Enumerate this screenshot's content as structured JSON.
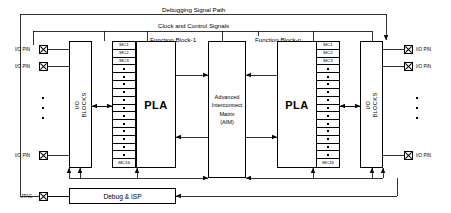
{
  "diagram": {
    "top_labels": {
      "debugging_signal_path": "Debugging Signal Path",
      "clock_and_control_signals": "Clock and Control Signals"
    },
    "function_blocks": [
      {
        "id": "fb1",
        "label": "Function Block-1",
        "pla_label": "PLA"
      },
      {
        "id": "fbn",
        "label": "Function Block-n",
        "pla_label": "PLA"
      }
    ],
    "io_blocks": [
      {
        "id": "io-left",
        "line1": "I/O",
        "line2": "BLOCKS"
      },
      {
        "id": "io-right",
        "line1": "I/O",
        "line2": "BLOCKS"
      }
    ],
    "aim": {
      "lines": [
        "Advanced",
        "Interconnect",
        "Matrix",
        "(AIM)"
      ]
    },
    "debug_isp": {
      "label": "Debug & ISP"
    },
    "macrocells": {
      "top_labels": [
        "MC1",
        "MC2",
        "MC3"
      ],
      "bottom_label": "MC16",
      "dot_rows": 12,
      "total_rows": 16
    },
    "pins": {
      "io_pin_label": "I/O PIN",
      "jtag_label": "JTAG",
      "left": [
        {
          "label": "I/O PIN"
        },
        {
          "label": "I/O PIN"
        },
        {
          "label": "I/O PIN"
        }
      ],
      "right": [
        {
          "label": "I/O PIN"
        },
        {
          "label": "I/O PIN"
        },
        {
          "label": "I/O PIN"
        }
      ],
      "jtag": {
        "label": "JTAG"
      }
    },
    "ellipsis_dots": 3,
    "colors": {
      "line": "#000000",
      "background": "#ffffff",
      "fill": "#ffffff"
    }
  }
}
